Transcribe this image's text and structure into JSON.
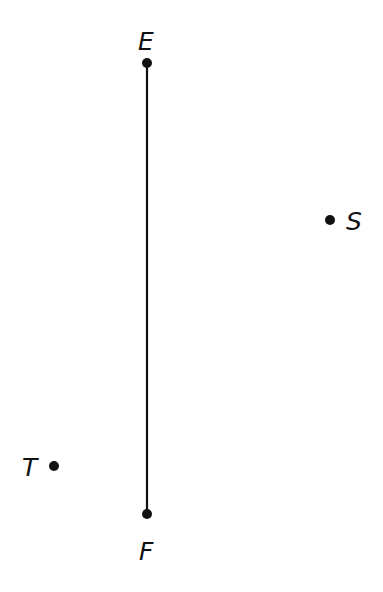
{
  "diagram": {
    "type": "geometry",
    "segments": [
      {
        "from": "E",
        "to": "F",
        "color": "#111111",
        "width": 2.2
      }
    ],
    "points": [
      {
        "name": "E",
        "x": 147,
        "y": 63,
        "label": "E",
        "label_x": 138,
        "label_y": 50
      },
      {
        "name": "F",
        "x": 147,
        "y": 514,
        "label": "F",
        "label_x": 139,
        "label_y": 560
      },
      {
        "name": "S",
        "x": 330,
        "y": 220,
        "label": "S",
        "label_x": 346,
        "label_y": 230
      },
      {
        "name": "T",
        "x": 54,
        "y": 466,
        "label": "T",
        "label_x": 22,
        "label_y": 476
      }
    ],
    "point_radius": 5,
    "color": "#111111"
  }
}
